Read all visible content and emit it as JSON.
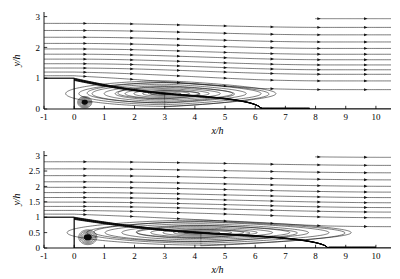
{
  "figure": {
    "background": "#ffffff",
    "stroke_color": "#111111",
    "panel_count": 2
  },
  "chart_data": [
    {
      "type": "line",
      "panel": "top",
      "title": "",
      "xlabel": "x/h",
      "ylabel": "y/h",
      "xlim": [
        -1,
        10.5
      ],
      "ylim": [
        0,
        3.15
      ],
      "xticks": [
        -1,
        0,
        1,
        2,
        3,
        4,
        5,
        6,
        7,
        8,
        9,
        10
      ],
      "xticklabels": [
        "-1",
        "0",
        "1",
        "2",
        "3",
        "4",
        "5",
        "6",
        "7",
        "8",
        "9",
        "10"
      ],
      "yticks": [
        0,
        1,
        2,
        3
      ],
      "yticklabels": [
        "0",
        "1",
        "2",
        "3"
      ],
      "grid": false,
      "legend": null,
      "description": "Streamline pattern of turbulent flow over a backward-facing step",
      "step": {
        "corner_x": 0,
        "step_height": 1.0,
        "inlet_floor_y": 1.0
      },
      "reattachment_x": 6.2,
      "primary_vortex": {
        "x": 3.0,
        "y": 0.5
      },
      "corner_vortex": {
        "x": 0.35,
        "y": 0.22
      },
      "freestream_levels": [
        1.08,
        1.2,
        1.33,
        1.47,
        1.62,
        1.78,
        1.95,
        2.13,
        2.33,
        2.55,
        2.78,
        3.05
      ],
      "freestream_exit_drop": 0.22,
      "recirc_contours": [
        0.06,
        0.13,
        0.2,
        0.28,
        0.36,
        0.45,
        0.55,
        0.66,
        0.78,
        0.9
      ],
      "arrow_spacing_x": 1.55,
      "arrow_offset_x": 0.35
    },
    {
      "type": "line",
      "panel": "bottom",
      "title": "",
      "xlabel": "x/h",
      "ylabel": "y/h",
      "xlim": [
        -1,
        10.5
      ],
      "ylim": [
        0,
        3.15
      ],
      "xticks": [
        -1,
        0,
        1,
        2,
        3,
        4,
        5,
        6,
        7,
        8,
        9,
        10
      ],
      "xticklabels": [
        "-1",
        "0",
        "1",
        "2",
        "3",
        "4",
        "5",
        "6",
        "7",
        "8",
        "9",
        "10"
      ],
      "yticks": [
        0,
        0.5,
        1,
        1.5,
        2,
        2.5,
        3
      ],
      "yticklabels": [
        "0",
        "0.5",
        "1",
        "1.5",
        "2",
        "2.5",
        "3"
      ],
      "grid": false,
      "legend": null,
      "description": "Streamline pattern of turbulent flow over a backward-facing step with longer recirculation",
      "step": {
        "corner_x": 0,
        "step_height": 1.0,
        "inlet_floor_y": 1.0
      },
      "reattachment_x": 8.4,
      "primary_vortex": {
        "x": 4.2,
        "y": 0.5
      },
      "corner_vortex": {
        "x": 0.45,
        "y": 0.35
      },
      "freestream_levels": [
        1.1,
        1.22,
        1.35,
        1.49,
        1.64,
        1.8,
        1.97,
        2.15,
        2.35,
        2.57,
        2.8,
        3.05
      ],
      "freestream_exit_drop": 0.2,
      "recirc_contours": [
        0.05,
        0.11,
        0.18,
        0.25,
        0.33,
        0.42,
        0.52,
        0.63,
        0.75,
        0.88
      ],
      "arrow_spacing_x": 1.55,
      "arrow_offset_x": 0.35
    }
  ]
}
